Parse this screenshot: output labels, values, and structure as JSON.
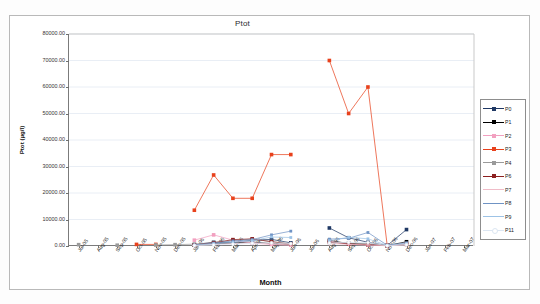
{
  "chart_data": {
    "type": "line",
    "title": "Ptot",
    "xlabel": "Month",
    "ylabel": "Ptot (µg/l)",
    "ylim": [
      0,
      80000
    ],
    "ytick_step": 10000,
    "ytick_labels": [
      "80000.00",
      "70000.00",
      "60000.00",
      "50000.00",
      "40000.00",
      "30000.00",
      "20000.00",
      "10000.00",
      "0.00"
    ],
    "grid": true,
    "legend_position": "right",
    "categories": [
      "Jul-05",
      "Aug-05",
      "Sep-05",
      "Oct-05",
      "Nov-05",
      "Dec-05",
      "Jan-06",
      "Feb-06",
      "Mar-06",
      "Apr-06",
      "May-06",
      "Jun-06",
      "Jul-06",
      "Aug-06",
      "Sep-06",
      "Oct-06",
      "Nov-06",
      "Dec-06",
      "Jan-07",
      "Feb-07",
      "Mar-07"
    ],
    "series": [
      {
        "name": "P0",
        "color": "#1f3864",
        "marker": "square",
        "values": [
          null,
          null,
          null,
          null,
          null,
          null,
          500,
          1400,
          1300,
          2200,
          2500,
          1200,
          null,
          6800,
          3100,
          1400,
          200,
          6200,
          null,
          null,
          null
        ]
      },
      {
        "name": "P1",
        "color": "#000000",
        "marker": "square",
        "values": [
          null,
          null,
          null,
          null,
          null,
          null,
          300,
          900,
          1100,
          1500,
          900,
          400,
          null,
          2100,
          900,
          600,
          150,
          1600,
          null,
          null,
          null
        ]
      },
      {
        "name": "P2",
        "color": "#f2a0c0",
        "marker": "square",
        "values": [
          null,
          null,
          null,
          null,
          null,
          null,
          2200,
          4200,
          2200,
          1100,
          600,
          300,
          null,
          1800,
          700,
          400,
          120,
          900,
          null,
          null,
          null
        ]
      },
      {
        "name": "P3",
        "color": "#e8411c",
        "marker": "square",
        "values": [
          null,
          null,
          null,
          600,
          600,
          null,
          13500,
          26800,
          18000,
          18000,
          34500,
          34500,
          null,
          70000,
          50000,
          60000,
          200,
          null,
          null,
          null,
          null
        ]
      },
      {
        "name": "P4",
        "color": "#9a9a9a",
        "marker": "square",
        "values": [
          500,
          null,
          300,
          null,
          400,
          500,
          700,
          1300,
          2100,
          2600,
          1700,
          800,
          null,
          1500,
          1100,
          900,
          200,
          700,
          null,
          null,
          null
        ]
      },
      {
        "name": "P6",
        "color": "#8c2020",
        "marker": "square",
        "values": [
          null,
          null,
          null,
          null,
          null,
          null,
          400,
          1200,
          2400,
          2700,
          1600,
          700,
          null,
          1400,
          800,
          500,
          150,
          600,
          null,
          null,
          null
        ]
      },
      {
        "name": "P7",
        "color": "#f0bcc8",
        "marker": "plus",
        "values": [
          null,
          null,
          null,
          null,
          null,
          null,
          200,
          600,
          900,
          1200,
          800,
          400,
          null,
          900,
          600,
          400,
          100,
          400,
          null,
          null,
          null
        ]
      },
      {
        "name": "P8",
        "color": "#6f93c4",
        "marker": "line",
        "values": [
          null,
          null,
          null,
          null,
          null,
          null,
          400,
          1100,
          1900,
          2400,
          4200,
          5600,
          null,
          2600,
          2900,
          5100,
          300,
          1200,
          null,
          null,
          null
        ]
      },
      {
        "name": "P9",
        "color": "#9dc3e6",
        "marker": "line",
        "values": [
          null,
          null,
          null,
          null,
          null,
          null,
          300,
          800,
          1400,
          2000,
          3400,
          3200,
          null,
          2000,
          3300,
          2700,
          250,
          900,
          null,
          null,
          null
        ]
      },
      {
        "name": "P11",
        "color": "#dce6f2",
        "marker": "dot",
        "values": [
          null,
          null,
          null,
          null,
          null,
          null,
          200,
          400,
          700,
          1000,
          1200,
          900,
          null,
          1100,
          1400,
          1300,
          100,
          500,
          null,
          null,
          null
        ]
      }
    ]
  }
}
